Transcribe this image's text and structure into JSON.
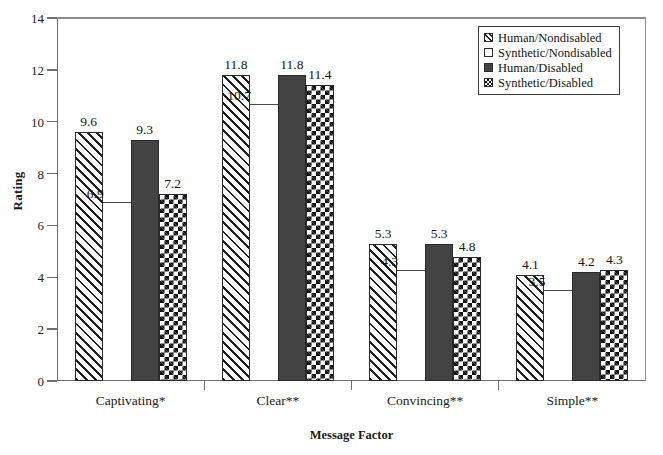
{
  "chart_data": {
    "type": "bar",
    "title": "",
    "xlabel": "Message Factor",
    "ylabel": "Rating",
    "ylim": [
      0,
      14
    ],
    "yticks": [
      0,
      2,
      4,
      6,
      8,
      10,
      12,
      14
    ],
    "grid": false,
    "legend_position": "top-right",
    "categories": [
      "Captivating*",
      "Clear**",
      "Convincing**",
      "Simple**"
    ],
    "series": [
      {
        "name": "Human/Nondisabled",
        "pattern": "diagonal-hatch",
        "values": [
          9.6,
          11.8,
          5.3,
          4.1
        ]
      },
      {
        "name": "Synthetic/Nondisabled",
        "pattern": "white-fill",
        "values": [
          6.9,
          10.7,
          4.3,
          3.5
        ]
      },
      {
        "name": "Human/Disabled",
        "pattern": "dark-solid",
        "values": [
          9.3,
          11.8,
          5.3,
          4.2
        ]
      },
      {
        "name": "Synthetic/Disabled",
        "pattern": "checkerboard",
        "values": [
          7.2,
          11.4,
          4.8,
          4.3
        ]
      }
    ],
    "colors": {
      "dark_fill": "#434343",
      "outline": "#2a2a2a",
      "axis": "#6f6f6f",
      "background": "#ffffff"
    }
  },
  "axes": {
    "y_title": "Rating",
    "x_title": "Message Factor",
    "y_tick_labels": [
      "0",
      "2",
      "4",
      "6",
      "8",
      "10",
      "12",
      "14"
    ],
    "x_tick_labels": [
      "Captivating*",
      "Clear**",
      "Convincing**",
      "Simple**"
    ]
  },
  "legend": {
    "items": [
      {
        "label": "Human/Nondisabled",
        "swatch": "diagonal-hatch-swatch"
      },
      {
        "label": "Synthetic/Nondisabled",
        "swatch": "white-fill-swatch"
      },
      {
        "label": "Human/Disabled",
        "swatch": "dark-solid-swatch"
      },
      {
        "label": "Synthetic/Disabled",
        "swatch": "checkerboard-swatch"
      }
    ]
  },
  "value_labels": {
    "group_0": [
      "9.6",
      "6.9",
      "9.3",
      "7.2"
    ],
    "group_1": [
      "11.8",
      "10.7",
      "11.8",
      "11.4"
    ],
    "group_2": [
      "5.3",
      "4.3",
      "5.3",
      "4.8"
    ],
    "group_3": [
      "4.1",
      "3.5",
      "4.2",
      "4.3"
    ]
  }
}
